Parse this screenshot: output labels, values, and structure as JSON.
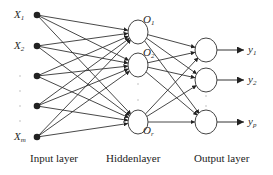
{
  "diagram": {
    "type": "neural-network",
    "colors": {
      "line": "#333333",
      "node_fill": "#ffffff",
      "input_node": "#222222",
      "text": "#2a2a2a"
    },
    "input_layer": {
      "title": "Input layer",
      "nodes": [
        {
          "base": "X",
          "sub": "1",
          "y": 15
        },
        {
          "base": "X",
          "sub": "2",
          "y": 46
        },
        {
          "base": "",
          "sub": "",
          "y": 76
        },
        {
          "base": "",
          "sub": "",
          "y": 106
        },
        {
          "base": "X",
          "sub": "m",
          "y": 137
        }
      ]
    },
    "hidden_layer": {
      "title": "Hiddenlayer",
      "nodes": [
        {
          "base": "O",
          "sub": "1",
          "y": 32
        },
        {
          "base": "O",
          "sub": "2",
          "y": 65
        },
        {
          "base": "O",
          "sub": "r",
          "y": 122
        }
      ]
    },
    "output_layer": {
      "title": "Output layer",
      "nodes": [
        {
          "base": "y",
          "sub": "1",
          "y": 50
        },
        {
          "base": "y",
          "sub": "2",
          "y": 80
        },
        {
          "base": "y",
          "sub": "p",
          "y": 122
        }
      ]
    }
  }
}
